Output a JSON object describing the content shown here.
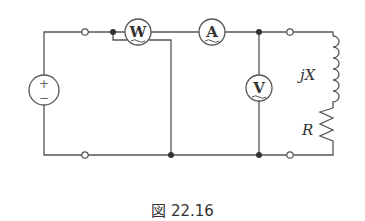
{
  "diagram": {
    "type": "circuit",
    "components": {
      "source": {
        "symbol_plus": "+",
        "symbol_minus": "−"
      },
      "wattmeter": {
        "letter": "W"
      },
      "ammeter": {
        "letter": "A"
      },
      "voltmeter": {
        "letter": "V"
      },
      "inductor": {
        "label": "jX"
      },
      "resistor": {
        "label": "R"
      }
    },
    "caption": "図 22.16"
  }
}
